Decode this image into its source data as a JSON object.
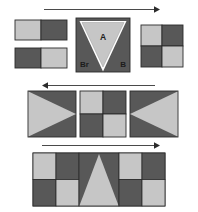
{
  "figure": {
    "background": "#ffffff",
    "colors": {
      "light": "#c6c6c6",
      "dark": "#585858",
      "outline": "#2b2b2b",
      "arrow": "#4a4a4a",
      "label_text": "#1c1c1c"
    },
    "labels": {
      "apex": "A",
      "left_corner": "Br",
      "right_corner": "B"
    },
    "arrows": [
      {
        "name": "arrow-row1",
        "direction": "right",
        "x1": 44,
        "y1": 9,
        "x2": 158,
        "y2": 9
      },
      {
        "name": "arrow-row2",
        "direction": "left",
        "x1": 155,
        "y1": 85,
        "x2": 42,
        "y2": 85
      },
      {
        "name": "arrow-row3",
        "direction": "right",
        "x1": 42,
        "y1": 145,
        "x2": 158,
        "y2": 145
      }
    ],
    "rows": [
      {
        "name": "row-1",
        "panels": [
          {
            "name": "panel-split-bars",
            "kind": "two-stacked-bars",
            "top": [
              "light",
              "dark"
            ],
            "bottom": [
              "dark",
              "light"
            ]
          },
          {
            "name": "panel-v-triangle",
            "kind": "inverted-triangle",
            "triangle": "light",
            "field": "dark"
          },
          {
            "name": "panel-checker-right",
            "kind": "checkerboard",
            "cells": [
              "light",
              "dark",
              "dark",
              "light"
            ]
          }
        ]
      },
      {
        "name": "row-2",
        "panels": [
          {
            "name": "panel-triangle-right",
            "kind": "triangle-pointing-right",
            "triangle": "light",
            "field": "dark"
          },
          {
            "name": "panel-checker-center",
            "kind": "checkerboard",
            "cells": [
              "light",
              "dark",
              "dark",
              "light"
            ]
          },
          {
            "name": "panel-triangle-left",
            "kind": "triangle-pointing-left",
            "triangle": "light",
            "field": "dark"
          }
        ]
      },
      {
        "name": "row-3",
        "panels": [
          {
            "name": "panel-wide-composite",
            "kind": "checker-triangle-checker",
            "left_cells": [
              "light",
              "dark",
              "dark",
              "light"
            ],
            "center_triangle": "light",
            "center_field": "dark",
            "right_cells": [
              "light",
              "dark",
              "dark",
              "light"
            ]
          }
        ]
      }
    ]
  }
}
